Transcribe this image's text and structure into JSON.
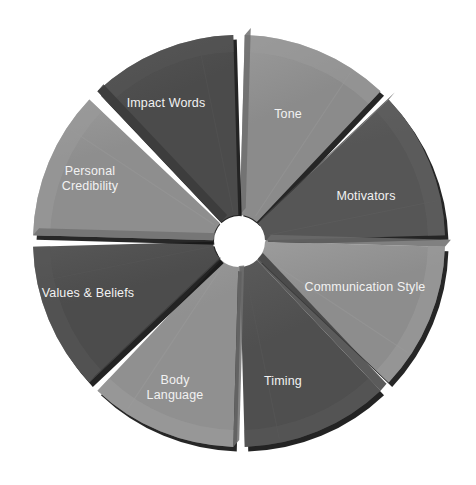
{
  "diagram": {
    "type": "segmented-wheel",
    "title": "",
    "center": {
      "x": 239,
      "y": 241
    },
    "outer_radius": 206,
    "inner_radius": 26,
    "segment_count": 8,
    "gap_degrees": 3.2,
    "background_color": "#ffffff",
    "label_color": "#f0f0f0",
    "label_font_size": 12.5,
    "segments": [
      {
        "id": "tone",
        "label": "Tone",
        "label_lines": [
          "Tone"
        ],
        "start_angle": -90,
        "end_angle": -45,
        "fill": "#8b8b8b",
        "bevel": "#6f6f6f",
        "rim": "#9a9a9a",
        "shadow": "#141414",
        "label_x": 288,
        "label_y": 115,
        "bevel_side": "top"
      },
      {
        "id": "motivators",
        "label": "Motivators",
        "label_lines": [
          "Motivators"
        ],
        "start_angle": -45,
        "end_angle": 0,
        "fill": "#565656",
        "bevel": "#434343",
        "rim": "#606060",
        "shadow": "#121212",
        "label_x": 366,
        "label_y": 197,
        "bevel_side": "top"
      },
      {
        "id": "communication-style",
        "label": "Communication Style",
        "label_lines": [
          "Communication Style"
        ],
        "start_angle": 0,
        "end_angle": 45,
        "fill": "#8d8d8d",
        "bevel": "#6a6a6a",
        "rim": "#9c9c9c",
        "shadow": "#141414",
        "label_x": 365,
        "label_y": 288,
        "bevel_side": "top"
      },
      {
        "id": "timing",
        "label": "Timing",
        "label_lines": [
          "Timing"
        ],
        "start_angle": 45,
        "end_angle": 90,
        "fill": "#4f4f4f",
        "bevel": "#3e3e3e",
        "rim": "#5a5a5a",
        "shadow": "#101010",
        "label_x": 283,
        "label_y": 382,
        "bevel_side": "top"
      },
      {
        "id": "body-language",
        "label": "Body Language",
        "label_lines": [
          "Body",
          "Language"
        ],
        "start_angle": 90,
        "end_angle": 135,
        "fill": "#909090",
        "bevel": "#6e6e6e",
        "rim": "#9d9d9d",
        "shadow": "#141414",
        "label_x": 175,
        "label_y": 388,
        "bevel_side": "top"
      },
      {
        "id": "values-beliefs",
        "label": "Values & Beliefs",
        "label_lines": [
          "Values & Beliefs"
        ],
        "start_angle": 135,
        "end_angle": 180,
        "fill": "#4c4c4c",
        "bevel": "#3a3a3a",
        "rim": "#585858",
        "shadow": "#101010",
        "label_x": 88,
        "label_y": 294,
        "bevel_side": "top"
      },
      {
        "id": "personal-credibility",
        "label": "Personal Credibility",
        "label_lines": [
          "Personal",
          "Credibility"
        ],
        "start_angle": 180,
        "end_angle": 225,
        "fill": "#8e8e8e",
        "bevel": "#727272",
        "rim": "#9b9b9b",
        "shadow": "#151515",
        "label_x": 90,
        "label_y": 179,
        "bevel_side": "top"
      },
      {
        "id": "impact-words",
        "label": "Impact Words",
        "label_lines": [
          "Impact Words"
        ],
        "start_angle": 225,
        "end_angle": 270,
        "fill": "#4b4b4b",
        "bevel": "#3b3b3b",
        "rim": "#565656",
        "shadow": "#111111",
        "label_x": 166,
        "label_y": 104,
        "bevel_side": "top"
      }
    ]
  }
}
